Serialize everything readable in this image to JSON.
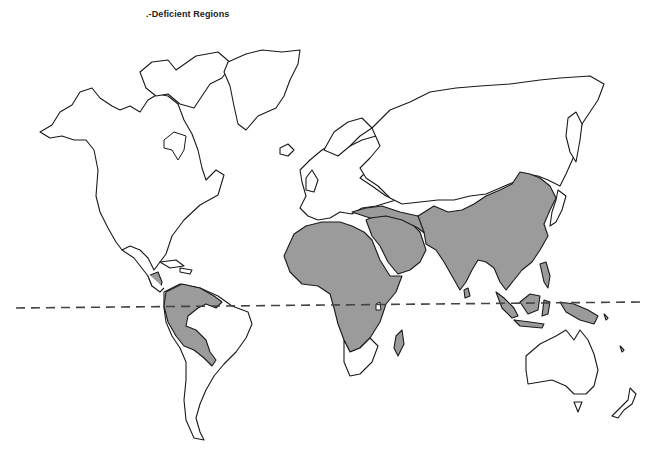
{
  "map": {
    "title": ".-Deficient Regions",
    "shaded_color": "#9b9b9b",
    "outline_color": "#1a1a1a",
    "background": "#ffffff",
    "legend": {
      "shaded_meaning": "Deficient region",
      "dashed_line": "Equator"
    },
    "regions": {
      "shaded": [
        "Central America",
        "Northern South America (Andes/Amazon)",
        "Africa (north & central)",
        "Madagascar",
        "Middle East / Arabian Peninsula",
        "Turkey",
        "Central & South Asia",
        "China",
        "Southeast Asia",
        "Indonesia",
        "Philippines",
        "New Guinea"
      ],
      "unshaded": [
        "North America",
        "Greenland",
        "Caribbean",
        "Southern South America",
        "Eastern Brazil",
        "Southern Africa",
        "Europe",
        "Russia / Siberia",
        "Japan",
        "Australia",
        "New Zealand"
      ]
    }
  }
}
